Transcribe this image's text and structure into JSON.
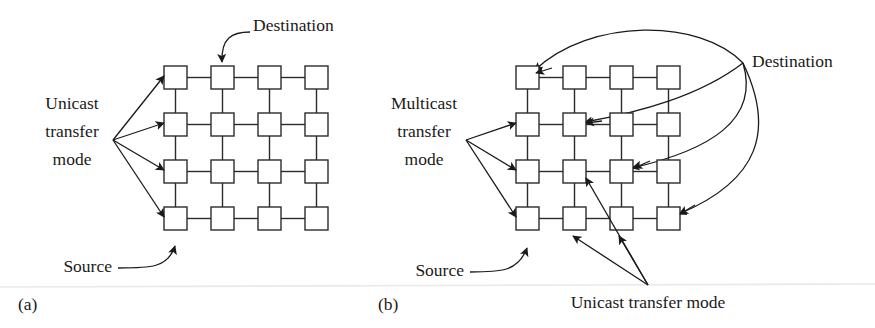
{
  "figure": {
    "background": "#ffffff",
    "ink_color": "#1a1a1a",
    "node_stroke": "#2b2b2b",
    "panels": [
      {
        "key": "a",
        "caption": "(a)",
        "mode_label_lines": [
          "Unicast",
          "transfer",
          "mode"
        ],
        "destination_label": "Destination",
        "source_label": "Source",
        "grid": {
          "rows": 4,
          "cols": 4,
          "node_size": 23,
          "pitch": 47,
          "origin_x": 164,
          "origin_y": 66
        },
        "fan_origin": {
          "x": 113,
          "y": 140
        },
        "fan_targets": [
          {
            "x": 160,
            "y": 78
          },
          {
            "x": 160,
            "y": 125
          },
          {
            "x": 160,
            "y": 172
          },
          {
            "x": 160,
            "y": 219
          }
        ],
        "destination_node": {
          "row": 0,
          "col": 1
        },
        "source_node": {
          "row": 3,
          "col": 0
        }
      },
      {
        "key": "b",
        "caption": "(b)",
        "mode_label_lines": [
          "Multicast",
          "transfer",
          "mode"
        ],
        "destination_label": "Destination",
        "source_label": "Source",
        "unicast_label": "Unicast transfer mode",
        "grid": {
          "rows": 4,
          "cols": 4,
          "node_size": 23,
          "pitch": 47,
          "origin_x": 516,
          "origin_y": 66
        },
        "fan_origin": {
          "x": 466,
          "y": 140
        },
        "fan_targets": [
          {
            "x": 512,
            "y": 125
          },
          {
            "x": 512,
            "y": 172
          },
          {
            "x": 512,
            "y": 219
          }
        ],
        "destination_point": {
          "x": 743,
          "y": 63
        },
        "destination_targets": [
          {
            "row": 0,
            "col": 0
          },
          {
            "row": 1,
            "col": 1
          },
          {
            "row": 2,
            "col": 2
          },
          {
            "row": 3,
            "col": 3
          }
        ],
        "unicast_fan_origin": {
          "x": 648,
          "y": 285
        },
        "unicast_targets": [
          {
            "x": 585,
            "y": 178
          },
          {
            "x": 572,
            "y": 237
          },
          {
            "x": 618,
            "y": 237
          }
        ],
        "source_node": {
          "row": 3,
          "col": 0
        }
      }
    ]
  },
  "text": {
    "a_unicast_l1": "Unicast",
    "a_unicast_l2": "transfer",
    "a_unicast_l3": "mode",
    "a_destination": "Destination",
    "a_source": "Source",
    "a_caption": "(a)",
    "b_multicast_l1": "Multicast",
    "b_multicast_l2": "transfer",
    "b_multicast_l3": "mode",
    "b_destination": "Destination",
    "b_source": "Source",
    "b_unicast": "Unicast transfer mode",
    "b_caption": "(b)"
  }
}
